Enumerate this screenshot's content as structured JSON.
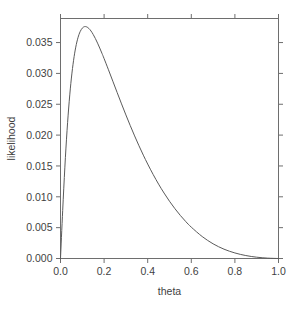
{
  "chart_data": {
    "type": "line",
    "title": "",
    "xlabel": "theta",
    "ylabel": "likelihood",
    "xlim": [
      0.0,
      1.0
    ],
    "ylim": [
      0.0,
      0.0389
    ],
    "grid": false,
    "legend": null,
    "x_ticks": [
      0.0,
      0.2,
      0.4,
      0.6,
      0.8,
      1.0
    ],
    "x_tick_labels": [
      "0.0",
      "0.2",
      "0.4",
      "0.6",
      "0.8",
      "1.0"
    ],
    "y_ticks": [
      0.0,
      0.005,
      0.01,
      0.015,
      0.02,
      0.025,
      0.03,
      0.035
    ],
    "y_tick_labels": [
      "0.000",
      "0.005",
      "0.010",
      "0.015",
      "0.020",
      "0.025",
      "0.030",
      "0.035"
    ],
    "peak": {
      "x": 0.1,
      "y": 0.0385
    },
    "series": [
      {
        "name": "likelihood",
        "color": "#5a5a5a",
        "x": [
          0.0,
          0.01,
          0.02,
          0.03,
          0.04,
          0.05,
          0.06,
          0.07,
          0.08,
          0.09,
          0.1,
          0.11,
          0.12,
          0.13,
          0.14,
          0.15,
          0.16,
          0.17,
          0.18,
          0.19,
          0.2,
          0.22,
          0.24,
          0.26,
          0.28,
          0.3,
          0.32,
          0.34,
          0.36,
          0.38,
          0.4,
          0.425,
          0.45,
          0.475,
          0.5,
          0.525,
          0.55,
          0.575,
          0.6,
          0.65,
          0.7,
          0.75,
          0.8,
          0.85,
          0.9,
          0.95,
          1.0
        ],
        "y": [
          0.0,
          0.00776,
          0.0148,
          0.02071,
          0.02549,
          0.02925,
          0.03213,
          0.03426,
          0.03577,
          0.03676,
          0.03734,
          0.03758,
          0.03754,
          0.03729,
          0.03687,
          0.03631,
          0.03565,
          0.03491,
          0.03411,
          0.03327,
          0.0324,
          0.03059,
          0.02874,
          0.02689,
          0.02506,
          0.02327,
          0.02154,
          0.01987,
          0.01827,
          0.01675,
          0.01531,
          0.01362,
          0.01205,
          0.01061,
          0.00928,
          0.00807,
          0.00697,
          0.00597,
          0.00508,
          0.00356,
          0.00238,
          0.00151,
          0.0009,
          0.00048,
          0.00021,
          6e-05,
          0.0
        ]
      }
    ]
  },
  "axis": {
    "x_title": "theta",
    "y_title": "likelihood"
  }
}
